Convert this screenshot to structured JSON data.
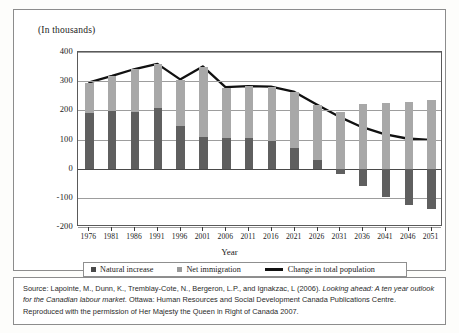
{
  "chart_data": {
    "type": "bar",
    "subtype": "stacked-bar-with-line",
    "title": "(In thousands)",
    "xlabel": "Year",
    "ylabel": "",
    "ylim": [
      -200,
      400
    ],
    "yticks": [
      400,
      300,
      200,
      100,
      0,
      -100,
      -200
    ],
    "ytick_labels": [
      "400",
      "300",
      "200",
      "100",
      "0",
      "-100",
      "-200"
    ],
    "grid": true,
    "legend_position": "bottom",
    "categories": [
      "1976",
      "1981",
      "1986",
      "1991",
      "1996",
      "2001",
      "2006",
      "2011",
      "2016",
      "2021",
      "2026",
      "2031",
      "2036",
      "2041",
      "2046",
      "2051"
    ],
    "series": [
      {
        "name": "Natural increase",
        "type": "bar",
        "color": "#5f5f5f",
        "values": [
          192,
          199,
          194,
          207,
          146,
          110,
          104,
          104,
          95,
          70,
          31,
          -19,
          -61,
          -96,
          -124,
          -139
        ]
      },
      {
        "name": "Net immigration",
        "type": "bar",
        "color": "#a8a8a8",
        "values": [
          103,
          118,
          147,
          152,
          159,
          240,
          174,
          178,
          185,
          193,
          188,
          195,
          222,
          226,
          230,
          234
        ]
      },
      {
        "name": "Change in total population",
        "type": "line",
        "color": "#111111",
        "values": [
          295,
          317,
          341,
          359,
          305,
          350,
          278,
          282,
          280,
          263,
          219,
          176,
          140,
          115,
          100,
          95
        ]
      }
    ]
  },
  "legend": {
    "items": [
      {
        "label": "Natural increase",
        "marker": "square",
        "color": "#4a4a4a"
      },
      {
        "label": "Net immigration",
        "marker": "square",
        "color": "#9a9a9a"
      },
      {
        "label": "Change in total population",
        "marker": "line",
        "color": "#111111"
      }
    ]
  },
  "source": {
    "line1_plain_a": "Source: Lapointe, M., Dunn, K., Tremblay-Cote, N., Bergeron, L.P., and Ignakzac, L (2006). ",
    "line1_italic": "Looking ahead: A ten year outlook for the Canadian labour market.",
    "line2_plain": " Ottawa: Human Resources and Social Development Canada Publications Centre. Reproduced with the permission of Her Majesty the Queen in Right of Canada 2007."
  }
}
